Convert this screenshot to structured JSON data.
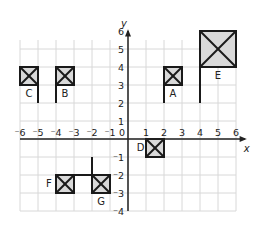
{
  "axes": {
    "x_label": "x",
    "y_label": "y",
    "x_ticks": [
      "⁻6",
      "⁻5",
      "⁻4",
      "⁻3",
      "⁻2",
      "⁻1",
      "0",
      "1",
      "2",
      "3",
      "4",
      "5",
      "6"
    ],
    "y_ticks_pos": [
      "1",
      "2",
      "3",
      "4",
      "5",
      "6"
    ],
    "y_ticks_neg": [
      "⁻1",
      "⁻2",
      "⁻3",
      "⁻4"
    ],
    "x_range": [
      -6,
      6
    ],
    "y_range": [
      -4,
      6
    ]
  },
  "flags": [
    {
      "label": "A",
      "box": [
        2,
        3,
        3,
        4
      ],
      "pole": [
        [
          2,
          2
        ],
        [
          2,
          4
        ]
      ]
    },
    {
      "label": "B",
      "box": [
        -4,
        3,
        -3,
        4
      ],
      "pole": [
        [
          -4,
          2
        ],
        [
          -4,
          4
        ]
      ]
    },
    {
      "label": "C",
      "box": [
        -6,
        3,
        -5,
        4
      ],
      "pole": [
        [
          -5,
          2
        ],
        [
          -5,
          4
        ]
      ]
    },
    {
      "label": "D",
      "box": [
        1,
        -1,
        2,
        0
      ],
      "pole": [
        [
          1,
          0
        ],
        [
          2,
          0
        ]
      ]
    },
    {
      "label": "E",
      "box": [
        4,
        4,
        6,
        6
      ],
      "pole": [
        [
          4,
          2
        ],
        [
          4,
          6
        ]
      ]
    },
    {
      "label": "F",
      "box": [
        -4,
        -3,
        -3,
        -2
      ],
      "pole": [
        [
          -3,
          -2
        ],
        [
          -2,
          -2
        ]
      ]
    },
    {
      "label": "G",
      "box": [
        -2,
        -3,
        -1,
        -2
      ],
      "pole": [
        [
          -2,
          -1
        ],
        [
          -2,
          -3
        ]
      ]
    }
  ],
  "colors": {
    "grid": "#d8d8d8",
    "fill": "#d9d9d9",
    "stroke": "#1a1a1a"
  }
}
